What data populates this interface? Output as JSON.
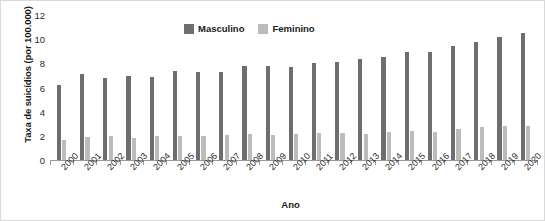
{
  "chart_data": {
    "type": "bar",
    "title": "",
    "xlabel": "Ano",
    "ylabel": "Taxa de suicídios (por 100.000)",
    "ylim": [
      0,
      12
    ],
    "yticks": [
      0,
      2,
      4,
      6,
      8,
      10,
      12
    ],
    "grid": false,
    "legend_position": "top-center",
    "categories": [
      "2000",
      "2001",
      "2002",
      "2003",
      "2004",
      "2005",
      "2006",
      "2007",
      "2008",
      "2009",
      "2010",
      "2011",
      "2012",
      "2013",
      "2014",
      "2015",
      "2016",
      "2017",
      "2018",
      "2019",
      "2020"
    ],
    "series": [
      {
        "name": "Masculino",
        "color": "#6e6e6e",
        "values": [
          6.2,
          7.1,
          6.75,
          6.95,
          6.9,
          7.4,
          7.3,
          7.3,
          7.8,
          7.75,
          7.7,
          8.0,
          8.1,
          8.4,
          8.5,
          8.9,
          8.9,
          9.4,
          9.8,
          10.2,
          10.5
        ]
      },
      {
        "name": "Feminino",
        "color": "#bcbcbc",
        "values": [
          1.65,
          1.9,
          1.95,
          1.85,
          2.0,
          2.0,
          2.0,
          2.1,
          2.15,
          2.05,
          2.15,
          2.2,
          2.2,
          2.15,
          2.3,
          2.4,
          2.35,
          2.55,
          2.7,
          2.8,
          2.85
        ]
      }
    ]
  },
  "legend": {
    "items": [
      {
        "label": "Masculino",
        "color": "#6e6e6e"
      },
      {
        "label": "Feminino",
        "color": "#bcbcbc"
      }
    ]
  },
  "axes": {
    "y_title": "Taxa de suicídios (por 100.000)",
    "x_title": "Ano"
  }
}
